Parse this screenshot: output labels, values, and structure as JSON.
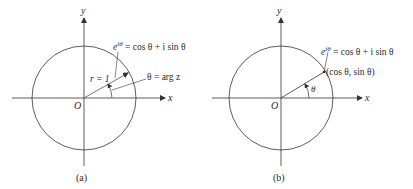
{
  "panels": [
    {
      "id": "a",
      "caption": "(a)",
      "axis_x_label": "x",
      "axis_y_label": "y",
      "origin_label": "O",
      "radius_label": "r = 1",
      "euler_label_base": "e",
      "euler_label_exp": "iθ",
      "euler_label_rest": " = cos θ + i sin θ",
      "angle_label": "θ = arg z"
    },
    {
      "id": "b",
      "caption": "(b)",
      "axis_x_label": "x",
      "axis_y_label": "y",
      "origin_label": "O",
      "euler_label_base": "e",
      "euler_label_exp": "iθ",
      "euler_label_rest": " = cos θ + i sin θ",
      "point_label": "(cos θ, sin θ)",
      "angle_label": "θ"
    }
  ],
  "colors": {
    "line": "#333333",
    "text": "#2a2a2a"
  }
}
